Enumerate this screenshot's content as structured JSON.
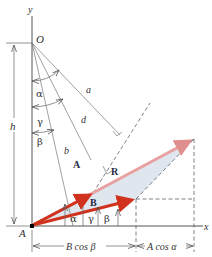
{
  "figure": {
    "points": {
      "origin_O": "O",
      "point_A": "A"
    },
    "axes": {
      "x_label": "x",
      "y_label": "y"
    },
    "vectors": {
      "A_label": "A",
      "B_label": "B",
      "R_label": "R"
    },
    "distances": {
      "a_label": "a",
      "b_label": "b",
      "d_label": "d",
      "h_label": "h"
    },
    "angles": {
      "alpha_top": "α",
      "gamma_top": "γ",
      "beta_top": "β",
      "alpha_bottom": "α",
      "gamma_bottom": "γ",
      "beta_bottom": "β"
    },
    "dimensions": {
      "b_cos_beta": "B cos β",
      "a_cos_alpha": "A cos α"
    },
    "colors": {
      "vector_red": "#d0321e",
      "resultant_pink": "#e8a0a0",
      "shade_blue": "#dfe6ee",
      "line_gray": "#6b6b6b",
      "dash_gray": "#6b7380"
    }
  }
}
